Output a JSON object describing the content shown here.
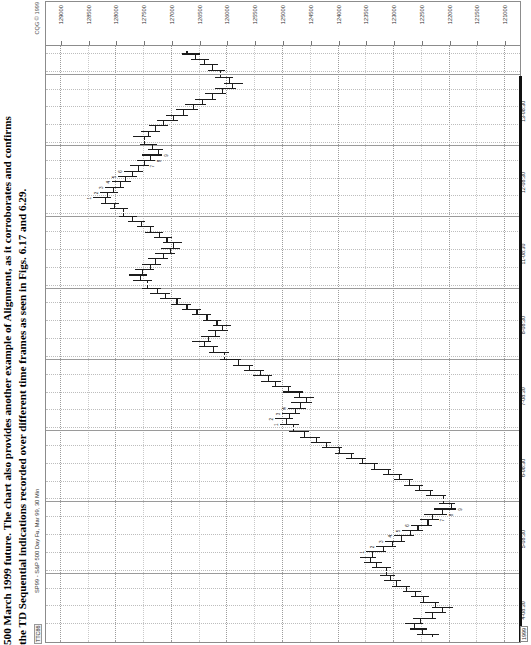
{
  "caption": {
    "lead": "500 March 1999 future.",
    "line1": "500 March 1999 future. The chart also provides another example of Alignment, as it corroborates and confirms",
    "line2": "the TD Sequential indications recorded over different time frames as seen in Figs. 6.17 and 6.29."
  },
  "chart_header": {
    "ticker_code": "TTC86",
    "symbol_title": "SP99 - S&P 500 Day Fu, Mar 99, 30 Min",
    "copyright": "CQG © 1999"
  },
  "chart_data": {
    "type": "ohlc",
    "title": "SP99 - S&P 500 Day Fu, Mar 99, 30 Min",
    "xlabel": "",
    "ylabel": "",
    "grid": true,
    "legend": "none",
    "ylim": [
      120750,
      129250
    ],
    "y_ticks": [
      129000,
      128500,
      128000,
      127500,
      127000,
      126500,
      126000,
      125500,
      125000,
      124500,
      124000,
      123500,
      123000,
      122500,
      122000,
      121500,
      121000
    ],
    "x_ticks": [
      {
        "label": "4-08:30",
        "pos": 0.055
      },
      {
        "label": "5-08:30",
        "pos": 0.175
      },
      {
        "label": "6-08:30",
        "pos": 0.295
      },
      {
        "label": "7-08:30",
        "pos": 0.415
      },
      {
        "label": "8-08:30",
        "pos": 0.535
      },
      {
        "label": "11-08:30",
        "pos": 0.655
      },
      {
        "label": "12-08:30",
        "pos": 0.775
      },
      {
        "label": "13-08:30",
        "pos": 0.895
      }
    ],
    "year_label": "1999",
    "session_breaks": [
      0.115,
      0.235,
      0.355,
      0.475,
      0.595,
      0.715,
      0.835,
      0.955
    ],
    "bars": [
      {
        "x": 0.012,
        "o": 122300,
        "h": 122560,
        "l": 122180,
        "c": 122480,
        "td": ""
      },
      {
        "x": 0.021,
        "o": 122480,
        "h": 122700,
        "l": 122380,
        "c": 122620,
        "td": ""
      },
      {
        "x": 0.03,
        "o": 122620,
        "h": 122780,
        "l": 122460,
        "c": 122520,
        "td": ""
      },
      {
        "x": 0.039,
        "o": 122520,
        "h": 122640,
        "l": 122220,
        "c": 122300,
        "td": ""
      },
      {
        "x": 0.048,
        "o": 122300,
        "h": 122420,
        "l": 122040,
        "c": 122120,
        "td": ""
      },
      {
        "x": 0.057,
        "o": 122120,
        "h": 122300,
        "l": 121920,
        "c": 122240,
        "td": ""
      },
      {
        "x": 0.066,
        "o": 122240,
        "h": 122520,
        "l": 122180,
        "c": 122460,
        "td": ""
      },
      {
        "x": 0.075,
        "o": 122460,
        "h": 122680,
        "l": 122360,
        "c": 122600,
        "td": ""
      },
      {
        "x": 0.084,
        "o": 122600,
        "h": 122820,
        "l": 122500,
        "c": 122760,
        "td": ""
      },
      {
        "x": 0.093,
        "o": 122760,
        "h": 123020,
        "l": 122700,
        "c": 122940,
        "td": ""
      },
      {
        "x": 0.102,
        "o": 122940,
        "h": 123160,
        "l": 122860,
        "c": 123060,
        "td": ""
      },
      {
        "x": 0.111,
        "o": 123060,
        "h": 123240,
        "l": 122960,
        "c": 123120,
        "td": ""
      },
      {
        "x": 0.124,
        "o": 123120,
        "h": 123380,
        "l": 123040,
        "c": 123300,
        "td": ""
      },
      {
        "x": 0.133,
        "o": 123300,
        "h": 123520,
        "l": 123200,
        "c": 123420,
        "td": ""
      },
      {
        "x": 0.142,
        "o": 123420,
        "h": 123600,
        "l": 123300,
        "c": 123380,
        "td": ""
      },
      {
        "x": 0.151,
        "o": 123380,
        "h": 123480,
        "l": 123120,
        "c": 123180,
        "td": "1"
      },
      {
        "x": 0.16,
        "o": 123180,
        "h": 123300,
        "l": 122940,
        "c": 123020,
        "td": "2"
      },
      {
        "x": 0.169,
        "o": 123020,
        "h": 123140,
        "l": 122780,
        "c": 122860,
        "td": "3"
      },
      {
        "x": 0.178,
        "o": 122860,
        "h": 122980,
        "l": 122620,
        "c": 122700,
        "td": "4"
      },
      {
        "x": 0.187,
        "o": 122700,
        "h": 122840,
        "l": 122460,
        "c": 122560,
        "td": "5"
      },
      {
        "x": 0.196,
        "o": 122560,
        "h": 122680,
        "l": 122300,
        "c": 122380,
        "td": "6"
      },
      {
        "x": 0.205,
        "o": 122380,
        "h": 122520,
        "l": 122180,
        "c": 122300,
        "td": "7"
      },
      {
        "x": 0.214,
        "o": 122300,
        "h": 122440,
        "l": 122020,
        "c": 122120,
        "td": "8"
      },
      {
        "x": 0.223,
        "o": 122120,
        "h": 122260,
        "l": 121860,
        "c": 121960,
        "td": "9"
      },
      {
        "x": 0.232,
        "o": 121960,
        "h": 122180,
        "l": 121880,
        "c": 122100,
        "td": ""
      },
      {
        "x": 0.245,
        "o": 122100,
        "h": 122400,
        "l": 122040,
        "c": 122340,
        "td": ""
      },
      {
        "x": 0.254,
        "o": 122340,
        "h": 122600,
        "l": 122280,
        "c": 122540,
        "td": ""
      },
      {
        "x": 0.263,
        "o": 122540,
        "h": 122800,
        "l": 122460,
        "c": 122720,
        "td": ""
      },
      {
        "x": 0.272,
        "o": 122720,
        "h": 122980,
        "l": 122640,
        "c": 122900,
        "td": ""
      },
      {
        "x": 0.281,
        "o": 122900,
        "h": 123180,
        "l": 122840,
        "c": 123100,
        "td": ""
      },
      {
        "x": 0.29,
        "o": 123100,
        "h": 123400,
        "l": 123040,
        "c": 123340,
        "td": ""
      },
      {
        "x": 0.299,
        "o": 123340,
        "h": 123620,
        "l": 123280,
        "c": 123560,
        "td": ""
      },
      {
        "x": 0.308,
        "o": 123560,
        "h": 123840,
        "l": 123480,
        "c": 123760,
        "td": ""
      },
      {
        "x": 0.317,
        "o": 123760,
        "h": 124040,
        "l": 123700,
        "c": 123980,
        "td": ""
      },
      {
        "x": 0.326,
        "o": 123980,
        "h": 124280,
        "l": 123920,
        "c": 124200,
        "td": ""
      },
      {
        "x": 0.335,
        "o": 124200,
        "h": 124480,
        "l": 124120,
        "c": 124380,
        "td": ""
      },
      {
        "x": 0.344,
        "o": 124380,
        "h": 124680,
        "l": 124320,
        "c": 124600,
        "td": ""
      },
      {
        "x": 0.353,
        "o": 124600,
        "h": 124880,
        "l": 124520,
        "c": 124800,
        "td": ""
      },
      {
        "x": 0.366,
        "o": 124800,
        "h": 125040,
        "l": 124700,
        "c": 124920,
        "td": "1"
      },
      {
        "x": 0.375,
        "o": 124920,
        "h": 125120,
        "l": 124800,
        "c": 124880,
        "td": "2"
      },
      {
        "x": 0.384,
        "o": 124880,
        "h": 125000,
        "l": 124680,
        "c": 124760,
        "td": "3"
      },
      {
        "x": 0.393,
        "o": 124760,
        "h": 124900,
        "l": 124560,
        "c": 124680,
        "td": "4"
      },
      {
        "x": 0.402,
        "o": 124680,
        "h": 124840,
        "l": 124460,
        "c": 124560,
        "td": ""
      },
      {
        "x": 0.411,
        "o": 124560,
        "h": 124780,
        "l": 124420,
        "c": 124700,
        "td": ""
      },
      {
        "x": 0.42,
        "o": 124700,
        "h": 124980,
        "l": 124620,
        "c": 124900,
        "td": ""
      },
      {
        "x": 0.429,
        "o": 124900,
        "h": 125180,
        "l": 124840,
        "c": 125120,
        "td": ""
      },
      {
        "x": 0.438,
        "o": 125120,
        "h": 125380,
        "l": 125020,
        "c": 125260,
        "td": ""
      },
      {
        "x": 0.447,
        "o": 125260,
        "h": 125520,
        "l": 125180,
        "c": 125400,
        "td": ""
      },
      {
        "x": 0.456,
        "o": 125400,
        "h": 125680,
        "l": 125320,
        "c": 125600,
        "td": ""
      },
      {
        "x": 0.465,
        "o": 125600,
        "h": 125880,
        "l": 125520,
        "c": 125800,
        "td": ""
      },
      {
        "x": 0.474,
        "o": 125800,
        "h": 126120,
        "l": 125740,
        "c": 126040,
        "td": ""
      },
      {
        "x": 0.487,
        "o": 126040,
        "h": 126320,
        "l": 125960,
        "c": 126240,
        "td": ""
      },
      {
        "x": 0.496,
        "o": 126240,
        "h": 126500,
        "l": 126160,
        "c": 126400,
        "td": ""
      },
      {
        "x": 0.505,
        "o": 126400,
        "h": 126620,
        "l": 126280,
        "c": 126340,
        "td": ""
      },
      {
        "x": 0.514,
        "o": 126340,
        "h": 126460,
        "l": 126120,
        "c": 126200,
        "td": ""
      },
      {
        "x": 0.523,
        "o": 126200,
        "h": 126340,
        "l": 125980,
        "c": 126080,
        "td": ""
      },
      {
        "x": 0.532,
        "o": 126080,
        "h": 126240,
        "l": 125920,
        "c": 126180,
        "td": ""
      },
      {
        "x": 0.541,
        "o": 126180,
        "h": 126420,
        "l": 126100,
        "c": 126360,
        "td": ""
      },
      {
        "x": 0.55,
        "o": 126360,
        "h": 126620,
        "l": 126280,
        "c": 126540,
        "td": ""
      },
      {
        "x": 0.559,
        "o": 126540,
        "h": 126800,
        "l": 126460,
        "c": 126720,
        "td": ""
      },
      {
        "x": 0.568,
        "o": 126720,
        "h": 127000,
        "l": 126640,
        "c": 126900,
        "td": ""
      },
      {
        "x": 0.577,
        "o": 126900,
        "h": 127200,
        "l": 126820,
        "c": 127100,
        "td": ""
      },
      {
        "x": 0.586,
        "o": 127100,
        "h": 127380,
        "l": 127020,
        "c": 127260,
        "td": ""
      },
      {
        "x": 0.595,
        "o": 127260,
        "h": 127520,
        "l": 127180,
        "c": 127440,
        "td": ""
      },
      {
        "x": 0.608,
        "o": 127440,
        "h": 127680,
        "l": 127340,
        "c": 127560,
        "td": ""
      },
      {
        "x": 0.617,
        "o": 127560,
        "h": 127760,
        "l": 127440,
        "c": 127520,
        "td": ""
      },
      {
        "x": 0.626,
        "o": 127520,
        "h": 127640,
        "l": 127300,
        "c": 127380,
        "td": ""
      },
      {
        "x": 0.635,
        "o": 127380,
        "h": 127520,
        "l": 127180,
        "c": 127280,
        "td": ""
      },
      {
        "x": 0.644,
        "o": 127280,
        "h": 127420,
        "l": 127060,
        "c": 127140,
        "td": ""
      },
      {
        "x": 0.653,
        "o": 127140,
        "h": 127280,
        "l": 126920,
        "c": 127020,
        "td": ""
      },
      {
        "x": 0.662,
        "o": 127020,
        "h": 127180,
        "l": 126840,
        "c": 126960,
        "td": ""
      },
      {
        "x": 0.671,
        "o": 126960,
        "h": 127140,
        "l": 126800,
        "c": 127080,
        "td": ""
      },
      {
        "x": 0.68,
        "o": 127080,
        "h": 127300,
        "l": 126980,
        "c": 127220,
        "td": ""
      },
      {
        "x": 0.689,
        "o": 127220,
        "h": 127460,
        "l": 127140,
        "c": 127380,
        "td": ""
      },
      {
        "x": 0.698,
        "o": 127380,
        "h": 127620,
        "l": 127300,
        "c": 127540,
        "td": ""
      },
      {
        "x": 0.707,
        "o": 127540,
        "h": 127780,
        "l": 127460,
        "c": 127700,
        "td": ""
      },
      {
        "x": 0.716,
        "o": 127700,
        "h": 127940,
        "l": 127620,
        "c": 127860,
        "td": ""
      },
      {
        "x": 0.729,
        "o": 127860,
        "h": 128100,
        "l": 127780,
        "c": 128020,
        "td": ""
      },
      {
        "x": 0.738,
        "o": 128020,
        "h": 128260,
        "l": 127940,
        "c": 128180,
        "td": ""
      },
      {
        "x": 0.747,
        "o": 128180,
        "h": 128400,
        "l": 128080,
        "c": 128160,
        "td": "1"
      },
      {
        "x": 0.756,
        "o": 128160,
        "h": 128280,
        "l": 127960,
        "c": 128040,
        "td": "2"
      },
      {
        "x": 0.765,
        "o": 128040,
        "h": 128180,
        "l": 127840,
        "c": 127920,
        "td": "3"
      },
      {
        "x": 0.774,
        "o": 127920,
        "h": 128060,
        "l": 127720,
        "c": 127820,
        "td": "4"
      },
      {
        "x": 0.783,
        "o": 127820,
        "h": 127960,
        "l": 127620,
        "c": 127700,
        "td": "5"
      },
      {
        "x": 0.792,
        "o": 127700,
        "h": 127840,
        "l": 127500,
        "c": 127600,
        "td": "6"
      },
      {
        "x": 0.801,
        "o": 127600,
        "h": 127740,
        "l": 127400,
        "c": 127480,
        "td": "7"
      },
      {
        "x": 0.81,
        "o": 127480,
        "h": 127620,
        "l": 127280,
        "c": 127380,
        "td": "8"
      },
      {
        "x": 0.819,
        "o": 127380,
        "h": 127520,
        "l": 127160,
        "c": 127240,
        "td": "9"
      },
      {
        "x": 0.828,
        "o": 127240,
        "h": 127420,
        "l": 127140,
        "c": 127340,
        "td": ""
      },
      {
        "x": 0.837,
        "o": 127340,
        "h": 127560,
        "l": 127260,
        "c": 127480,
        "td": ""
      },
      {
        "x": 0.85,
        "o": 127480,
        "h": 127680,
        "l": 127360,
        "c": 127420,
        "td": ""
      },
      {
        "x": 0.859,
        "o": 127420,
        "h": 127540,
        "l": 127200,
        "c": 127280,
        "td": ""
      },
      {
        "x": 0.868,
        "o": 127280,
        "h": 127400,
        "l": 127060,
        "c": 127140,
        "td": ""
      },
      {
        "x": 0.877,
        "o": 127140,
        "h": 127260,
        "l": 126880,
        "c": 126960,
        "td": ""
      },
      {
        "x": 0.886,
        "o": 126960,
        "h": 127080,
        "l": 126700,
        "c": 126780,
        "td": ""
      },
      {
        "x": 0.895,
        "o": 126780,
        "h": 126900,
        "l": 126520,
        "c": 126600,
        "td": ""
      },
      {
        "x": 0.904,
        "o": 126600,
        "h": 126740,
        "l": 126360,
        "c": 126440,
        "td": ""
      },
      {
        "x": 0.913,
        "o": 126440,
        "h": 126560,
        "l": 126180,
        "c": 126260,
        "td": ""
      },
      {
        "x": 0.922,
        "o": 126260,
        "h": 126380,
        "l": 126000,
        "c": 126080,
        "td": ""
      },
      {
        "x": 0.931,
        "o": 126080,
        "h": 126200,
        "l": 125820,
        "c": 125900,
        "td": ""
      },
      {
        "x": 0.94,
        "o": 125900,
        "h": 126040,
        "l": 125700,
        "c": 125960,
        "td": ""
      },
      {
        "x": 0.949,
        "o": 125960,
        "h": 126200,
        "l": 125880,
        "c": 126120,
        "td": ""
      },
      {
        "x": 0.962,
        "o": 126120,
        "h": 126340,
        "l": 126020,
        "c": 126260,
        "td": ""
      },
      {
        "x": 0.971,
        "o": 126260,
        "h": 126480,
        "l": 126160,
        "c": 126400,
        "td": ""
      },
      {
        "x": 0.98,
        "o": 126400,
        "h": 126640,
        "l": 126320,
        "c": 126560,
        "td": ""
      },
      {
        "x": 0.989,
        "o": 126560,
        "h": 126800,
        "l": 126480,
        "c": 126720,
        "td": ""
      }
    ]
  }
}
